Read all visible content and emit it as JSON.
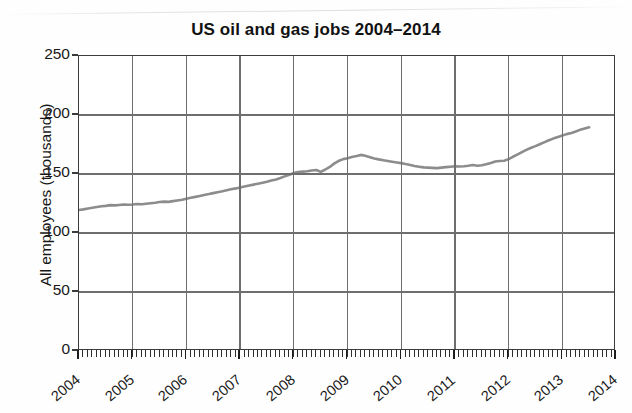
{
  "chart_data": {
    "type": "line",
    "title": "US oil and gas jobs 2004–2014",
    "xlabel": "",
    "ylabel": "All employees (thousands)",
    "ylim": [
      0,
      250
    ],
    "yticks": [
      0,
      50,
      100,
      150,
      200,
      250
    ],
    "ytick_labels": [
      "0",
      "50",
      "100",
      "150",
      "200",
      "250"
    ],
    "xlim": [
      2004,
      2014
    ],
    "xticks": [
      2004,
      2005,
      2006,
      2007,
      2008,
      2009,
      2010,
      2011,
      2012,
      2013,
      2014
    ],
    "xtick_labels": [
      "2004",
      "2005",
      "2006",
      "2007",
      "2008",
      "2009",
      "2010",
      "2011",
      "2012",
      "2013",
      "2014"
    ],
    "minor_tick_interval": "monthly",
    "grid": true,
    "legend": "none",
    "line_color": "#8c8c8c",
    "grid_color": "#6e6e6e",
    "axis_color": "#3b3b3b",
    "series": [
      {
        "name": "All employees (thousands)",
        "x": [
          2004.0,
          2004.08,
          2004.17,
          2004.25,
          2004.33,
          2004.42,
          2004.5,
          2004.58,
          2004.67,
          2004.75,
          2004.83,
          2004.92,
          2005.0,
          2005.08,
          2005.17,
          2005.25,
          2005.33,
          2005.42,
          2005.5,
          2005.58,
          2005.67,
          2005.75,
          2005.83,
          2005.92,
          2006.0,
          2006.08,
          2006.17,
          2006.25,
          2006.33,
          2006.42,
          2006.5,
          2006.58,
          2006.67,
          2006.75,
          2006.83,
          2006.92,
          2007.0,
          2007.08,
          2007.17,
          2007.25,
          2007.33,
          2007.42,
          2007.5,
          2007.58,
          2007.67,
          2007.75,
          2007.83,
          2007.92,
          2008.0,
          2008.08,
          2008.17,
          2008.25,
          2008.33,
          2008.42,
          2008.5,
          2008.58,
          2008.67,
          2008.75,
          2008.83,
          2008.92,
          2009.0,
          2009.08,
          2009.17,
          2009.25,
          2009.33,
          2009.42,
          2009.5,
          2009.58,
          2009.67,
          2009.75,
          2009.83,
          2009.92,
          2010.0,
          2010.08,
          2010.17,
          2010.25,
          2010.33,
          2010.42,
          2010.5,
          2010.58,
          2010.67,
          2010.75,
          2010.83,
          2010.92,
          2011.0,
          2011.08,
          2011.17,
          2011.25,
          2011.33,
          2011.42,
          2011.5,
          2011.58,
          2011.67,
          2011.75,
          2011.83,
          2011.92,
          2012.0,
          2012.08,
          2012.17,
          2012.25,
          2012.33,
          2012.42,
          2012.5,
          2012.58,
          2012.67,
          2012.75,
          2012.83,
          2012.92,
          2013.0,
          2013.08,
          2013.17,
          2013.25,
          2013.33,
          2013.42,
          2013.5
        ],
        "y": [
          119.5,
          120.0,
          120.8,
          121.4,
          122.0,
          122.6,
          123.0,
          123.6,
          123.4,
          123.8,
          124.2,
          124.0,
          124.2,
          124.6,
          124.4,
          124.8,
          125.2,
          125.6,
          126.2,
          126.6,
          126.4,
          127.0,
          127.6,
          128.2,
          129.0,
          129.8,
          130.6,
          131.4,
          132.2,
          133.0,
          133.8,
          134.6,
          135.4,
          136.2,
          137.0,
          137.8,
          138.6,
          139.4,
          140.2,
          141.0,
          141.8,
          142.6,
          143.4,
          144.4,
          145.4,
          146.6,
          148.0,
          149.4,
          150.8,
          151.6,
          152.0,
          152.4,
          153.0,
          153.4,
          151.8,
          153.6,
          156.0,
          158.8,
          161.0,
          162.6,
          163.4,
          164.4,
          165.2,
          166.2,
          165.4,
          164.2,
          163.2,
          162.4,
          161.6,
          161.0,
          160.4,
          159.8,
          159.2,
          158.4,
          157.6,
          156.8,
          156.2,
          155.6,
          155.4,
          155.2,
          155.0,
          155.4,
          155.8,
          156.2,
          156.6,
          156.4,
          156.6,
          157.0,
          157.6,
          157.0,
          157.4,
          158.2,
          159.4,
          160.6,
          161.0,
          161.2,
          162.6,
          164.6,
          166.6,
          168.6,
          170.4,
          172.2,
          173.6,
          175.2,
          177.0,
          178.6,
          180.0,
          181.4,
          182.6,
          183.8,
          184.8,
          186.0,
          187.4,
          188.6,
          189.6
        ]
      }
    ],
    "annotations": {
      "start_value": 120,
      "peak_value": 166,
      "peak_year": "2008",
      "trough_value": 155,
      "trough_year": "2010",
      "end_value": 210,
      "end_year": "2013"
    }
  }
}
